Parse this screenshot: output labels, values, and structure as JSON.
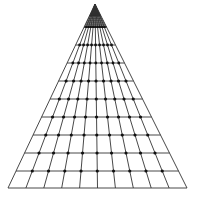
{
  "diagram": {
    "type": "perspective-grid-pyramid",
    "width": 199,
    "height": 198,
    "background": "#ffffff",
    "line_color": "#333333",
    "dot_color": "#111111",
    "apex": {
      "x": 95,
      "y": 4
    },
    "base": {
      "y": 188,
      "x_left": 8,
      "x_right": 187
    },
    "converging_lines": 11,
    "horizontal_rows_y": [
      27,
      45,
      63,
      81,
      99,
      117,
      135,
      153,
      171,
      188
    ],
    "dense_lines_region": {
      "y_from": 8,
      "y_to": 27,
      "count": 10
    },
    "dot_rows_y": [
      27,
      45,
      63,
      81,
      99,
      117,
      135,
      153,
      171
    ],
    "dot_radius": 1.6,
    "line_width": 0.9
  }
}
